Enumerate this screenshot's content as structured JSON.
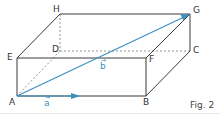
{
  "figure": {
    "caption": "Fig. 2",
    "colors": {
      "edge": "#3a3a3a",
      "hidden_edge": "#8a8a8a",
      "vector": "#3a8fc0"
    },
    "vertices": {
      "A": {
        "label": "A",
        "x": 17,
        "y": 96
      },
      "B": {
        "label": "B",
        "x": 146,
        "y": 96
      },
      "C": {
        "label": "C",
        "x": 190,
        "y": 51
      },
      "D": {
        "label": "D",
        "x": 60,
        "y": 51
      },
      "E": {
        "label": "E",
        "x": 17,
        "y": 58
      },
      "F": {
        "label": "F",
        "x": 146,
        "y": 58
      },
      "G": {
        "label": "G",
        "x": 190,
        "y": 14
      },
      "H": {
        "label": "H",
        "x": 60,
        "y": 14
      }
    },
    "vectors": {
      "a": {
        "label": "a",
        "arrow": "→",
        "from": "A",
        "to": "point on AB"
      },
      "b": {
        "label": "b",
        "arrow": "→",
        "from": "A",
        "to": "G"
      }
    }
  }
}
